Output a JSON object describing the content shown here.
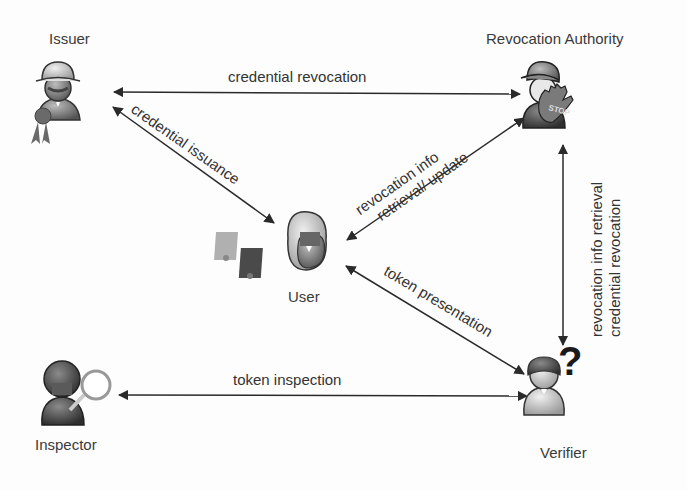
{
  "diagram": {
    "nodes": {
      "issuer": {
        "label": "Issuer",
        "icon": "issuer-icon"
      },
      "revocation_authority": {
        "label": "Revocation Authority",
        "icon": "revocation-authority-stop-icon"
      },
      "user": {
        "label": "User",
        "icon": "user-icon"
      },
      "inspector": {
        "label": "Inspector",
        "icon": "inspector-magnifier-icon"
      },
      "verifier": {
        "label": "Verifier",
        "icon": "verifier-question-icon"
      }
    },
    "edges": [
      {
        "from": "Issuer",
        "to": "Revocation Authority",
        "label": "credential revocation",
        "bidirectional": true
      },
      {
        "from": "Issuer",
        "to": "User",
        "label": "credential issuance",
        "bidirectional": true
      },
      {
        "from": "User",
        "to": "Revocation Authority",
        "label_line1": "revocation info",
        "label_line2": "retrieval/ update",
        "bidirectional": true
      },
      {
        "from": "User",
        "to": "Verifier",
        "label": "token presentation",
        "bidirectional": true
      },
      {
        "from": "Revocation Authority",
        "to": "Verifier",
        "label_line1": "revocation info retrieval",
        "label_line2": "credential revocation",
        "bidirectional": true
      },
      {
        "from": "Inspector",
        "to": "Verifier",
        "label": "token inspection",
        "bidirectional": true
      }
    ],
    "colors": {
      "line": "#2a2a2a",
      "text": "#333333",
      "background": "#fdfdfd"
    }
  }
}
